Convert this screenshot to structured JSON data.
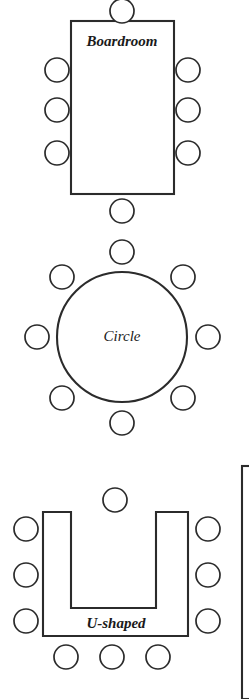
{
  "figure": {
    "background_color": "#ffffff",
    "line_color": "#2b2b2b",
    "text_color": "#1a1a1a",
    "width": 249,
    "height": 699
  },
  "layouts": [
    {
      "id": "boardroom",
      "label": "Boardroom",
      "label_style": "bold-italic",
      "label_x": 122,
      "label_y": 43,
      "label_size": 15,
      "table": {
        "shape": "rectangle",
        "x": 71,
        "y": 21,
        "width": 103,
        "height": 173
      },
      "chair_radius": 12,
      "chair_count": 8,
      "chairs": [
        {
          "x": 122,
          "y": 11,
          "side": "top"
        },
        {
          "x": 57,
          "y": 70,
          "side": "left"
        },
        {
          "x": 57,
          "y": 110,
          "side": "left"
        },
        {
          "x": 57,
          "y": 153,
          "side": "left"
        },
        {
          "x": 188,
          "y": 70,
          "side": "right"
        },
        {
          "x": 188,
          "y": 110,
          "side": "right"
        },
        {
          "x": 188,
          "y": 153,
          "side": "right"
        },
        {
          "x": 122,
          "y": 211,
          "side": "bottom"
        }
      ]
    },
    {
      "id": "circle",
      "label": "Circle",
      "label_style": "italic",
      "label_x": 122,
      "label_y": 338,
      "label_size": 15,
      "table": {
        "shape": "circle",
        "cx": 122,
        "cy": 337,
        "r": 65
      },
      "chair_radius": 12,
      "chair_count": 8,
      "chairs": [
        {
          "x": 122,
          "y": 252,
          "side": "top"
        },
        {
          "x": 62,
          "y": 277,
          "side": "top-left"
        },
        {
          "x": 183,
          "y": 277,
          "side": "top-right"
        },
        {
          "x": 37,
          "y": 337,
          "side": "left"
        },
        {
          "x": 208,
          "y": 337,
          "side": "right"
        },
        {
          "x": 62,
          "y": 398,
          "side": "bottom-left"
        },
        {
          "x": 183,
          "y": 398,
          "side": "bottom-right"
        },
        {
          "x": 122,
          "y": 423,
          "side": "bottom"
        }
      ]
    },
    {
      "id": "u-shaped",
      "label": "U-shaped",
      "label_style": "bold-italic",
      "label_x": 116,
      "label_y": 625,
      "label_size": 15,
      "table": {
        "shape": "u-polygon",
        "points": "43,512 71,512 71,608 156,608 156,512 188,512 188,636 43,636",
        "outer_left": 43,
        "outer_right": 188,
        "top": 512,
        "bottom": 636,
        "notch_left": 71,
        "notch_right": 156,
        "notch_bottom": 608
      },
      "chair_radius": 12,
      "chair_count": 10,
      "chairs": [
        {
          "x": 115,
          "y": 500,
          "side": "top"
        },
        {
          "x": 26,
          "y": 529,
          "side": "left"
        },
        {
          "x": 26,
          "y": 575,
          "side": "left"
        },
        {
          "x": 26,
          "y": 621,
          "side": "left"
        },
        {
          "x": 208,
          "y": 529,
          "side": "right"
        },
        {
          "x": 208,
          "y": 575,
          "side": "right"
        },
        {
          "x": 208,
          "y": 621,
          "side": "right"
        },
        {
          "x": 66,
          "y": 657,
          "side": "bottom"
        },
        {
          "x": 112,
          "y": 657,
          "side": "bottom"
        },
        {
          "x": 158,
          "y": 657,
          "side": "bottom"
        }
      ]
    }
  ],
  "partial_shape": {
    "id": "cropped-table-edge",
    "description": "partial rectangle cropped at right page edge",
    "x": 242,
    "y": 466,
    "width": 40,
    "height": 233
  }
}
